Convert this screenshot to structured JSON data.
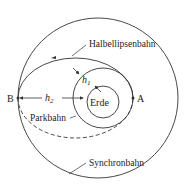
{
  "diagram": {
    "labels": {
      "transfer_orbit": "Halbellipsenbahn",
      "parking_orbit": "Parkbahn",
      "synchronous_orbit": "Synchronbahn",
      "earth": "Erde",
      "point_a": "A",
      "point_b": "B",
      "h1": "h",
      "h1_sub": "1",
      "h2": "h",
      "h2_sub": "2"
    },
    "colors": {
      "stroke": "#333333",
      "background": "#ffffff"
    }
  }
}
